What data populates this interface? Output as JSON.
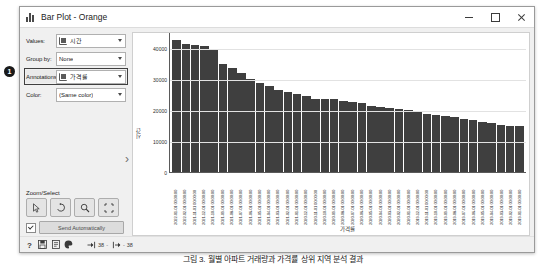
{
  "window": {
    "title": "Bar Plot - Orange",
    "title_icon": "bar-chart-icon",
    "controls": {
      "minimize": "minimize-icon",
      "maximize": "maximize-icon",
      "close": "close-icon"
    }
  },
  "panel": {
    "rows": [
      {
        "label": "Values:",
        "value": "시간",
        "has_icon": true,
        "highlighted": false
      },
      {
        "label": "Group by:",
        "value": "None",
        "has_icon": false,
        "highlighted": false
      },
      {
        "label": "Annotations:",
        "value": "가격률",
        "has_icon": true,
        "highlighted": true
      },
      {
        "label": "Color:",
        "value": "(Same color)",
        "has_icon": false,
        "highlighted": false
      }
    ],
    "expander_icon": "chevron-right-icon",
    "zoom_select": {
      "title": "Zoom/Select",
      "buttons": [
        {
          "name": "select-tool",
          "icon": "cursor-arrow-icon"
        },
        {
          "name": "pan-tool",
          "icon": "pan-hand-icon"
        },
        {
          "name": "zoom-tool",
          "icon": "magnifier-icon"
        },
        {
          "name": "reset-tool",
          "icon": "expand-corners-icon"
        }
      ]
    },
    "send": {
      "checkbox_checked": true,
      "button_label": "Send Automatically"
    }
  },
  "statusbar": {
    "icons": [
      "help-icon",
      "save-icon",
      "report-icon",
      "palette-icon"
    ],
    "input_icon": "input-arrow-icon",
    "input_count": "38",
    "separator": "-",
    "output_icon": "output-arrow-icon",
    "output_count": "38"
  },
  "callout": {
    "number": "1"
  },
  "caption": "그림 3. 월별 아파트 거래량과 가격률 상위 지역 분석 결과",
  "chart_data": {
    "type": "bar",
    "title": "",
    "xlabel": "가격률",
    "ylabel": "시간",
    "ylim": [
      0,
      45000
    ],
    "yticks": [
      0,
      10000,
      20000,
      30000,
      40000
    ],
    "ytick_labels": [
      "0",
      "10000",
      "20000",
      "30000",
      "40000"
    ],
    "grid": true,
    "legend": "none",
    "bar_color": "#3f3f3f",
    "categories": [
      "2022-01-01 00:00:00",
      "2022-02-01 00:00:00",
      "2021-11-01 00:00:00",
      "2021-12-01 00:00:00",
      "2021-10-01 00:00:00",
      "2021-09-01 00:00:00",
      "2021-08-01 00:00:00",
      "2021-07-01 00:00:00",
      "2021-06-01 00:00:00",
      "2021-05-01 00:00:00",
      "2021-04-01 00:00:00",
      "2021-03-01 00:00:00",
      "2021-02-01 00:00:00",
      "2021-01-01 00:00:00",
      "2020-12-01 00:00:00",
      "2020-11-01 00:00:00",
      "2020-10-01 00:00:00",
      "2020-09-01 00:00:00",
      "2020-08-01 00:00:00",
      "2020-07-01 00:00:00",
      "2020-06-01 00:00:00",
      "2020-05-01 00:00:00",
      "2020-04-01 00:00:00",
      "2020-03-01 00:00:00",
      "2020-02-01 00:00:00",
      "2020-01-01 00:00:00",
      "2019-12-01 00:00:00",
      "2019-11-01 00:00:00",
      "2019-10-01 00:00:00",
      "2019-09-01 00:00:00",
      "2019-08-01 00:00:00",
      "2019-07-01 00:00:00",
      "2019-06-01 00:00:00",
      "2019-05-01 00:00:00",
      "2019-04-01 00:00:00",
      "2019-03-01 00:00:00",
      "2019-02-01 00:00:00",
      "2019-01-01 00:00:00"
    ],
    "values": [
      42800,
      41600,
      41200,
      40700,
      39600,
      35200,
      33600,
      32100,
      30100,
      28900,
      28100,
      26600,
      25900,
      25300,
      24600,
      23900,
      23800,
      23700,
      23200,
      22900,
      22600,
      21600,
      21200,
      20900,
      20500,
      20100,
      19500,
      19100,
      18700,
      18300,
      17900,
      17500,
      17200,
      16500,
      16100,
      15300,
      15100,
      15000
    ]
  }
}
